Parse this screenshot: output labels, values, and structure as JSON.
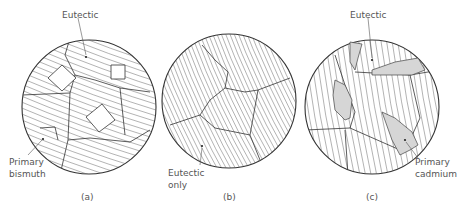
{
  "figure": {
    "panels": [
      {
        "id": "a",
        "caption": "(a)",
        "labels": [
          {
            "key": "eutectic",
            "lines": [
              "Eutectic"
            ]
          },
          {
            "key": "primary",
            "lines": [
              "Primary",
              "bismuth"
            ]
          }
        ]
      },
      {
        "id": "b",
        "caption": "(b)",
        "labels": [
          {
            "key": "eutectic",
            "lines": [
              "Eutectic",
              "only"
            ]
          }
        ]
      },
      {
        "id": "c",
        "caption": "(c)",
        "labels": [
          {
            "key": "eutectic",
            "lines": [
              "Eutectic"
            ]
          },
          {
            "key": "primary",
            "lines": [
              "Primary",
              "cadmium"
            ]
          }
        ]
      }
    ],
    "colors": {
      "outline": "#333333",
      "hatch": "#555555",
      "primary_cadmium_fill": "#d6d6d6",
      "text": "#555555"
    }
  }
}
